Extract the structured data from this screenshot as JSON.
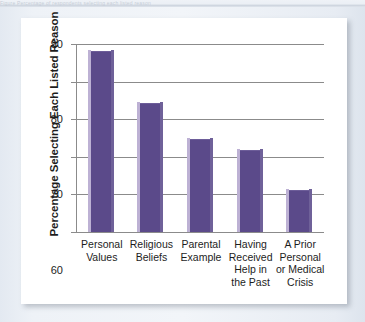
{
  "figure": {
    "cropped_top_caption": "Figure Percentage of respondents selecting each listed reason",
    "panel_background": "#ffffff",
    "page_background": "#e9eef5"
  },
  "chart_data": {
    "type": "bar",
    "title": "",
    "xlabel": "",
    "ylabel": "Percentage Selecting Each Listed Reason",
    "categories": [
      "Personal\nValues",
      "Religious\nBeliefs",
      "Parental\nExample",
      "Having\nReceived\nHelp in\nthe Past",
      "A Prior\nPersonal\nor Medical\nCrisis"
    ],
    "category_lines": [
      [
        "Personal",
        "Values"
      ],
      [
        "Religious",
        "Beliefs"
      ],
      [
        "Parental",
        "Example"
      ],
      [
        "Having",
        "Received",
        "Help in",
        "the Past"
      ],
      [
        "A Prior",
        "Personal",
        "or Medical",
        "Crisis"
      ]
    ],
    "values": [
      88,
      74,
      64.5,
      61.5,
      51
    ],
    "ylim": [
      40,
      90
    ],
    "yticks": [
      40,
      50,
      60,
      70,
      80,
      90
    ],
    "ytick_labels": [
      "40",
      "50",
      "60",
      "70",
      "80",
      "90"
    ],
    "grid": true,
    "legend": false,
    "bar_color": "#5b4a8a",
    "bar_highlight_color": "#bdb1d4",
    "bar_shade_color": "#6f6199",
    "axis_color": "#8b8b8b"
  }
}
